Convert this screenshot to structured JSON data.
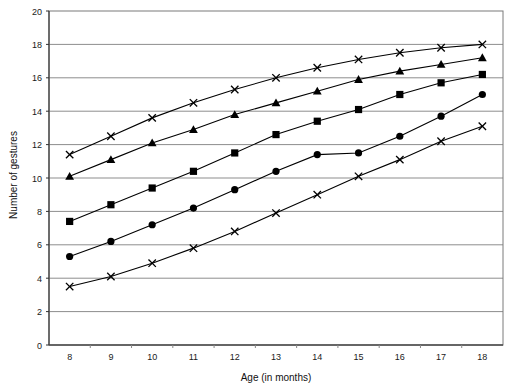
{
  "chart_data": {
    "type": "line",
    "title": "",
    "xlabel": "Age (in months)",
    "ylabel": "Number of gestures",
    "x": [
      8,
      9,
      10,
      11,
      12,
      13,
      14,
      15,
      16,
      17,
      18
    ],
    "xlim": [
      7.5,
      18.5
    ],
    "ylim": [
      0,
      20
    ],
    "xticks": [
      "8",
      "9",
      "10",
      "11",
      "12",
      "13",
      "14",
      "15",
      "16",
      "17",
      "18"
    ],
    "yticks": [
      "0",
      "2",
      "4",
      "6",
      "8",
      "10",
      "12",
      "14",
      "16",
      "18",
      "20"
    ],
    "ytick_step": 2,
    "grid": "horizontal",
    "legend": "none",
    "series": [
      {
        "name": "series-1-cross-upper",
        "marker": "cross",
        "values": [
          11.4,
          12.5,
          13.6,
          14.5,
          15.3,
          16.0,
          16.6,
          17.1,
          17.5,
          17.8,
          18.0
        ]
      },
      {
        "name": "series-2-triangle",
        "marker": "triangle",
        "values": [
          10.1,
          11.1,
          12.1,
          12.9,
          13.8,
          14.5,
          15.2,
          15.9,
          16.4,
          16.8,
          17.2
        ]
      },
      {
        "name": "series-3-square",
        "marker": "square",
        "values": [
          7.4,
          8.4,
          9.4,
          10.4,
          11.5,
          12.6,
          13.4,
          14.1,
          15.0,
          15.7,
          16.2
        ]
      },
      {
        "name": "series-4-circle",
        "marker": "circle",
        "values": [
          5.3,
          6.2,
          7.2,
          8.2,
          9.3,
          10.4,
          11.4,
          11.5,
          12.5,
          13.7,
          15.0
        ]
      },
      {
        "name": "series-5-cross-lower",
        "marker": "cross",
        "values": [
          3.5,
          4.1,
          4.9,
          5.8,
          6.8,
          7.9,
          9.0,
          10.1,
          11.1,
          12.2,
          13.1
        ]
      }
    ]
  }
}
